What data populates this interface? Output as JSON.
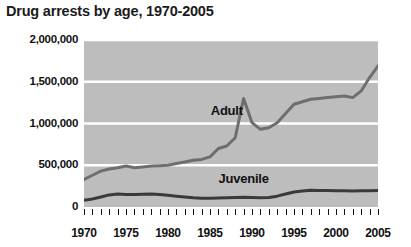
{
  "chart_data": {
    "type": "line",
    "title": "Drug arrests by age, 1970-2005",
    "xlabel": "",
    "ylabel": "",
    "grid": true,
    "legend_position": "inline-annotation",
    "xlim": [
      1970,
      2005
    ],
    "ylim": [
      0,
      2000000
    ],
    "ytick_labels": [
      "2,000,000",
      "1,500,000",
      "1,000,000",
      "500,000",
      "0"
    ],
    "ytick_values": [
      2000000,
      1500000,
      1000000,
      500000,
      0
    ],
    "xtick_labels": [
      "1970",
      "1975",
      "1980",
      "1985",
      "1990",
      "1995",
      "2000",
      "2005"
    ],
    "xtick_values": [
      1970,
      1975,
      1980,
      1985,
      1990,
      1995,
      2000,
      2005
    ],
    "minor_xticks_every": 1,
    "x": [
      1970,
      1971,
      1972,
      1973,
      1974,
      1975,
      1976,
      1977,
      1978,
      1979,
      1980,
      1981,
      1982,
      1983,
      1984,
      1985,
      1986,
      1987,
      1988,
      1989,
      1990,
      1991,
      1992,
      1993,
      1994,
      1995,
      1996,
      1997,
      1998,
      1999,
      2000,
      2001,
      2002,
      2003,
      2004,
      2005
    ],
    "series": [
      {
        "name": "Adult",
        "color": "#6e6e6e",
        "values": [
          330000,
          380000,
          430000,
          455000,
          470000,
          490000,
          470000,
          480000,
          490000,
          495000,
          500000,
          520000,
          540000,
          560000,
          570000,
          600000,
          700000,
          730000,
          830000,
          1300000,
          1010000,
          930000,
          950000,
          1010000,
          1120000,
          1230000,
          1260000,
          1290000,
          1300000,
          1310000,
          1320000,
          1330000,
          1310000,
          1390000,
          1550000,
          1690000
        ]
      },
      {
        "name": "Juvenile",
        "color": "#3a3a3a",
        "values": [
          80000,
          95000,
          120000,
          145000,
          155000,
          150000,
          150000,
          152000,
          155000,
          150000,
          140000,
          130000,
          120000,
          110000,
          105000,
          105000,
          108000,
          112000,
          115000,
          118000,
          115000,
          112000,
          115000,
          130000,
          155000,
          180000,
          192000,
          200000,
          198000,
          197000,
          196000,
          195000,
          192000,
          195000,
          196000,
          197000
        ]
      }
    ],
    "annotations": [
      {
        "text": "Adult",
        "x": 1987,
        "y": 1150000
      },
      {
        "text": "Juvenile",
        "x": 1989,
        "y": 330000
      }
    ]
  }
}
